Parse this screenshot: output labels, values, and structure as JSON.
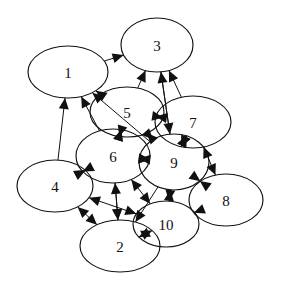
{
  "figure": {
    "kind": "directed-graph",
    "background_color": "#ffffff",
    "stroke_color": "#111111",
    "width": 282,
    "height": 288
  },
  "graph": {
    "node_count": 10,
    "nodes": [
      {
        "id": "1",
        "label": "1",
        "cx": 68,
        "cy": 72,
        "rx": 40,
        "ry": 26
      },
      {
        "id": "3",
        "label": "3",
        "cx": 157,
        "cy": 45,
        "rx": 36,
        "ry": 27
      },
      {
        "id": "5",
        "label": "5",
        "cx": 127,
        "cy": 112,
        "rx": 37,
        "ry": 25
      },
      {
        "id": "7",
        "label": "7",
        "cx": 193,
        "cy": 122,
        "rx": 38,
        "ry": 26
      },
      {
        "id": "6",
        "label": "6",
        "cx": 113,
        "cy": 156,
        "rx": 37,
        "ry": 27
      },
      {
        "id": "9",
        "label": "9",
        "cx": 174,
        "cy": 162,
        "rx": 35,
        "ry": 28
      },
      {
        "id": "4",
        "label": "4",
        "cx": 55,
        "cy": 186,
        "rx": 38,
        "ry": 26
      },
      {
        "id": "8",
        "label": "8",
        "cx": 226,
        "cy": 200,
        "rx": 37,
        "ry": 26
      },
      {
        "id": "10",
        "label": "10",
        "cx": 166,
        "cy": 224,
        "rx": 33,
        "ry": 23
      },
      {
        "id": "2",
        "label": "2",
        "cx": 120,
        "cy": 246,
        "rx": 40,
        "ry": 26
      }
    ],
    "edges": [
      {
        "from": "1",
        "to": "3",
        "bidirectional": false
      },
      {
        "from": "4",
        "to": "1",
        "bidirectional": false
      },
      {
        "from": "5",
        "to": "1",
        "bidirectional": false
      },
      {
        "from": "6",
        "to": "1",
        "bidirectional": false
      },
      {
        "from": "9",
        "to": "1",
        "bidirectional": false
      },
      {
        "from": "5",
        "to": "3",
        "bidirectional": false
      },
      {
        "from": "9",
        "to": "3",
        "bidirectional": false
      },
      {
        "from": "7",
        "to": "3",
        "bidirectional": false
      },
      {
        "from": "3",
        "to": "9",
        "bidirectional": false
      },
      {
        "from": "5",
        "to": "7",
        "bidirectional": true
      },
      {
        "from": "9",
        "to": "7",
        "bidirectional": true
      },
      {
        "from": "6",
        "to": "5",
        "bidirectional": true
      },
      {
        "from": "9",
        "to": "5",
        "bidirectional": true
      },
      {
        "from": "5",
        "to": "6",
        "bidirectional": false
      },
      {
        "from": "6",
        "to": "9",
        "bidirectional": true
      },
      {
        "from": "7",
        "to": "9",
        "bidirectional": true
      },
      {
        "from": "7",
        "to": "8",
        "bidirectional": true
      },
      {
        "from": "9",
        "to": "8",
        "bidirectional": true
      },
      {
        "from": "10",
        "to": "8",
        "bidirectional": false
      },
      {
        "from": "4",
        "to": "6",
        "bidirectional": true
      },
      {
        "from": "2",
        "to": "6",
        "bidirectional": true
      },
      {
        "from": "10",
        "to": "6",
        "bidirectional": true
      },
      {
        "from": "9",
        "to": "6",
        "bidirectional": false
      },
      {
        "from": "2",
        "to": "4",
        "bidirectional": true
      },
      {
        "from": "10",
        "to": "4",
        "bidirectional": true
      },
      {
        "from": "6",
        "to": "4",
        "bidirectional": false
      },
      {
        "from": "2",
        "to": "10",
        "bidirectional": true
      },
      {
        "from": "9",
        "to": "10",
        "bidirectional": true
      },
      {
        "from": "6",
        "to": "2",
        "bidirectional": false
      },
      {
        "from": "9",
        "to": "2",
        "bidirectional": false
      }
    ]
  }
}
